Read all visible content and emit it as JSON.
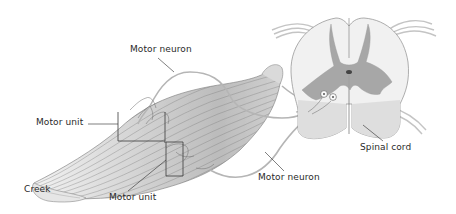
{
  "diagram": {
    "labels": {
      "motor_neuron_top": "Motor neuron",
      "motor_unit_left": "Motor unit",
      "creek": "Creek",
      "motor_unit_bottom": "Motor unit",
      "motor_neuron_bottom": "Motor neuron",
      "spinal_cord": "Spinal cord"
    },
    "colors": {
      "line": "#3a3a3a",
      "muscle_stroke": "#8a8a8a",
      "gray_matter": "#9a9a9a",
      "white_matter": "#efefef",
      "nerve": "#b8b8b8"
    }
  }
}
